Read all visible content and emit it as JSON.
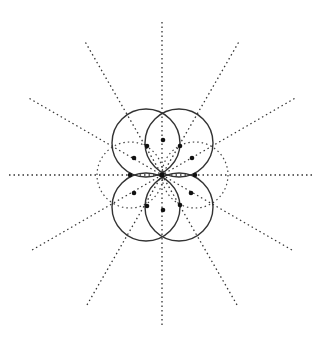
{
  "diagram": {
    "title": "",
    "center": [
      162,
      175
    ],
    "ray_length": 153,
    "ray_angles_deg": [
      0,
      30,
      60,
      90,
      120,
      150
    ],
    "solid_circles": [
      {
        "cx": 146,
        "cy": 143,
        "r": 34
      },
      {
        "cx": 179,
        "cy": 143,
        "r": 34
      },
      {
        "cx": 146,
        "cy": 207,
        "r": 34
      },
      {
        "cx": 179,
        "cy": 207,
        "r": 34
      }
    ],
    "dashed_circles": [
      {
        "cx": 130,
        "cy": 175,
        "r": 33
      },
      {
        "cx": 195,
        "cy": 175,
        "r": 33
      }
    ],
    "points": [
      [
        162,
        175
      ],
      [
        163,
        140
      ],
      [
        147,
        146
      ],
      [
        180,
        146
      ],
      [
        134,
        158
      ],
      [
        192,
        158
      ],
      [
        130,
        175
      ],
      [
        195,
        175
      ],
      [
        134,
        193
      ],
      [
        191,
        193
      ],
      [
        147,
        206
      ],
      [
        180,
        205
      ],
      [
        163,
        210
      ]
    ],
    "colors": {
      "line": "#333333",
      "dot": "#111111",
      "background": "#ffffff"
    }
  }
}
